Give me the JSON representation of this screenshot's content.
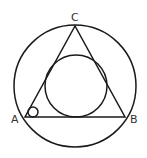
{
  "diagram": {
    "type": "geometry",
    "stroke_color": "#1a1a1a",
    "label_color": "#333333",
    "labels": {
      "A": "A",
      "B": "B",
      "C": "C"
    },
    "points": {
      "A": [
        25,
        117
      ],
      "B": [
        125,
        117
      ],
      "C": [
        75,
        26
      ]
    },
    "outer_circle": {
      "cx": 75,
      "cy": 86,
      "r": 61
    },
    "inner_circle": {
      "cx": 76,
      "cy": 86,
      "r": 31
    },
    "angle_mark_circle": {
      "cx": 33,
      "cy": 112,
      "r": 5
    }
  }
}
